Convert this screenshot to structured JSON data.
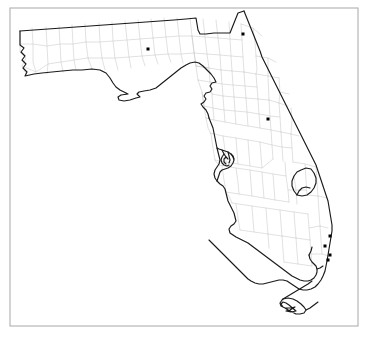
{
  "map": {
    "title": "Florida State Map",
    "region": "Florida, United States",
    "projection": "geographic",
    "background_color": "#ffffff",
    "frame": {
      "name": "map-frame",
      "color": "#b0b0b0",
      "stroke_width": 1.1,
      "x": 10,
      "y": 8,
      "width": 348,
      "height": 318
    },
    "layers": {
      "state_outline": {
        "label": "State and coastline boundary",
        "color": "#1a1a1a",
        "stroke_width": 1.15,
        "fill": "none"
      },
      "county_boundaries": {
        "label": "County boundaries",
        "color": "#c8c8c8",
        "stroke_width": 0.55,
        "fill": "none"
      },
      "water_bodies": {
        "label": "Lakes and bays",
        "color": "#1a1a1a",
        "stroke_width": 1.0,
        "fill": "none"
      },
      "points": {
        "label": "Site markers",
        "color": "#000000",
        "marker_shape": "square",
        "marker_size": 3
      }
    },
    "point_markers": [
      {
        "name": "marker-panhandle-tallahassee",
        "x": 148,
        "y": 49
      },
      {
        "name": "marker-northeast-jacksonville",
        "x": 243,
        "y": 34
      },
      {
        "name": "marker-central-orlando",
        "x": 268,
        "y": 119
      },
      {
        "name": "marker-southeast-palmbeach",
        "x": 330,
        "y": 236
      },
      {
        "name": "marker-southeast-fortlauderdale",
        "x": 325,
        "y": 246
      },
      {
        "name": "marker-southeast-miami",
        "x": 330,
        "y": 255
      },
      {
        "name": "marker-southeast-homestead",
        "x": 328,
        "y": 260
      }
    ],
    "named_features": {
      "lake_okeechobee": "Lake Okeechobee",
      "tampa_bay": "Tampa Bay",
      "florida_keys": "Florida Keys",
      "panhandle": "Florida Panhandle",
      "big_bend": "Big Bend Coast",
      "everglades": "Everglades"
    }
  }
}
